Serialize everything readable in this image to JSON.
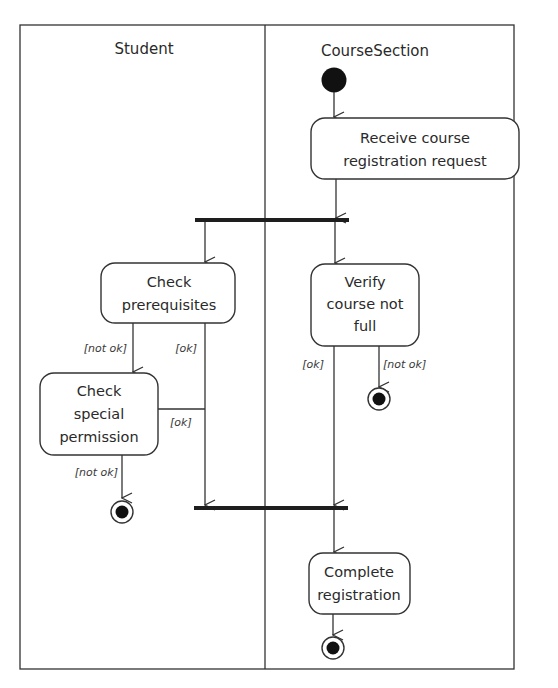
{
  "diagram": {
    "type": "uml-activity-diagram",
    "swimlanes": [
      {
        "id": "student",
        "label": "Student"
      },
      {
        "id": "course_section",
        "label": "CourseSection"
      }
    ],
    "nodes": {
      "start": {
        "kind": "initial",
        "lane": "course_section"
      },
      "receive": {
        "kind": "action",
        "lane": "course_section",
        "lines": [
          "Receive course",
          "registration request"
        ]
      },
      "fork": {
        "kind": "fork",
        "label": ""
      },
      "check_prereq": {
        "kind": "action",
        "lane": "student",
        "lines": [
          "Check",
          "prerequisites"
        ]
      },
      "verify": {
        "kind": "action",
        "lane": "course_section",
        "lines": [
          "Verify",
          "course not",
          "full"
        ]
      },
      "check_special": {
        "kind": "action",
        "lane": "student",
        "lines": [
          "Check",
          "special",
          "permission"
        ]
      },
      "end_student": {
        "kind": "final",
        "lane": "student"
      },
      "end_verify": {
        "kind": "final",
        "lane": "course_section"
      },
      "join": {
        "kind": "join",
        "label": ""
      },
      "complete": {
        "kind": "action",
        "lane": "course_section",
        "lines": [
          "Complete",
          "registration"
        ]
      },
      "end_main": {
        "kind": "final",
        "lane": "course_section"
      }
    },
    "guards": {
      "prereq_not_ok": "[not ok]",
      "prereq_ok": "[ok]",
      "special_ok": "[ok]",
      "special_not_ok": "[not ok]",
      "verify_ok": "[ok]",
      "verify_not_ok": "[not ok]"
    },
    "edges": [
      {
        "from": "start",
        "to": "receive",
        "guard": ""
      },
      {
        "from": "receive",
        "to": "fork",
        "guard": ""
      },
      {
        "from": "fork",
        "to": "check_prereq",
        "guard": ""
      },
      {
        "from": "fork",
        "to": "verify",
        "guard": ""
      },
      {
        "from": "check_prereq",
        "to": "check_special",
        "guard": "[not ok]"
      },
      {
        "from": "check_prereq",
        "to": "join",
        "guard": "[ok]"
      },
      {
        "from": "check_special",
        "to": "join",
        "guard": "[ok]"
      },
      {
        "from": "check_special",
        "to": "end_student",
        "guard": "[not ok]"
      },
      {
        "from": "verify",
        "to": "join",
        "guard": "[ok]"
      },
      {
        "from": "verify",
        "to": "end_verify",
        "guard": "[not ok]"
      },
      {
        "from": "join",
        "to": "complete",
        "guard": ""
      },
      {
        "from": "complete",
        "to": "end_main",
        "guard": ""
      }
    ]
  }
}
